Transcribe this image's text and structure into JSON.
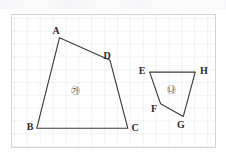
{
  "figure": {
    "frame": {
      "x": 11,
      "y": 14,
      "width": 205,
      "height": 134
    },
    "grid": {
      "cell_size": 13,
      "line_color": "#c8d4de",
      "style": "dotted",
      "background": "#ffffff",
      "border_color": "#d2d4d8"
    },
    "shapes": [
      {
        "name": "quadrilateral-abcd",
        "region_label": "㉮",
        "region_label_pos": {
          "x": 74,
          "y": 90
        },
        "stroke": "#3a3a3c",
        "stroke_width": 1.2,
        "points": "48,23 117,46 25,115 99,115",
        "polygon": "48,23 99,115 25,115",
        "path": "M 48 23 L 99 46 L 117 115 L 25 115 Z",
        "vertices": [
          {
            "id": "A",
            "label": "A",
            "px": 59,
            "py": 37,
            "label_x": 55,
            "label_y": 30
          },
          {
            "id": "B",
            "label": "B",
            "px": 36,
            "py": 129,
            "label_x": 29,
            "label_y": 126
          },
          {
            "id": "C",
            "label": "C",
            "px": 128,
            "py": 129,
            "label_x": 134,
            "label_y": 127
          },
          {
            "id": "D",
            "label": "D",
            "px": 110,
            "py": 60,
            "label_x": 106,
            "label_y": 55
          }
        ]
      },
      {
        "name": "quadrilateral-efgh",
        "region_label": "㉯",
        "region_label_pos": {
          "x": 170,
          "y": 89
        },
        "stroke": "#3a3a3c",
        "stroke_width": 1.2,
        "vertices": [
          {
            "id": "E",
            "label": "E",
            "px": 150,
            "py": 72,
            "label_x": 141,
            "label_y": 70
          },
          {
            "id": "H",
            "label": "H",
            "px": 196,
            "py": 72,
            "label_x": 203,
            "label_y": 70
          },
          {
            "id": "G",
            "label": "G",
            "px": 184,
            "py": 117,
            "label_x": 180,
            "label_y": 124
          },
          {
            "id": "F",
            "label": "F",
            "px": 161,
            "py": 104,
            "label_x": 153,
            "label_y": 108
          }
        ]
      }
    ]
  }
}
